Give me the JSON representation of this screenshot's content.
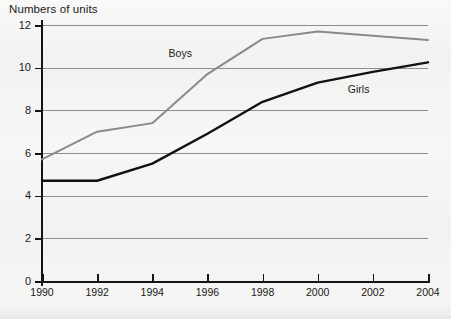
{
  "chart_data": {
    "type": "line",
    "title": "Numbers of units",
    "xlabel": "",
    "ylabel": "Numbers of units",
    "x": [
      1990,
      1992,
      1994,
      1996,
      1998,
      2000,
      2002,
      2004
    ],
    "xtick_labels": [
      "1990",
      "1992",
      "1994",
      "1996",
      "1998",
      "2000",
      "2002",
      "2004"
    ],
    "ytick_labels": [
      "0",
      "2",
      "4",
      "6",
      "8",
      "10",
      "12"
    ],
    "ytick_values": [
      0,
      2,
      4,
      6,
      8,
      10,
      12
    ],
    "xlim": [
      1990,
      2004
    ],
    "ylim": [
      0,
      12
    ],
    "grid": "horizontal",
    "legend_position": "inline-labels",
    "series": [
      {
        "name": "Boys",
        "color": "#8a8a8a",
        "values": [
          5.7,
          7.0,
          7.4,
          9.7,
          11.35,
          11.7,
          11.5,
          11.3
        ],
        "label_x": 1995.1,
        "label_y": 10.65
      },
      {
        "name": "Girls",
        "color": "#111111",
        "values": [
          4.7,
          4.7,
          5.5,
          6.9,
          8.4,
          9.3,
          9.8,
          10.25
        ],
        "label_x": 2001.6,
        "label_y": 8.95
      }
    ],
    "background_color": "#f2f2f0",
    "gridline_color": "#8d8d8d",
    "axis_color": "#141414"
  }
}
